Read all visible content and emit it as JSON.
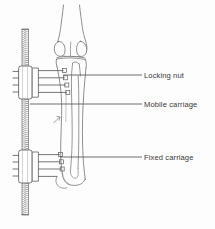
{
  "figure": {
    "background_color": "#fdfdfd",
    "line_color": "#555555",
    "text_color": "#3a3a3a"
  },
  "labels": [
    {
      "id": "locking-nut",
      "text": "Locking nut",
      "leader_y": 75,
      "leader_x_start": 63,
      "leader_x_end": 142
    },
    {
      "id": "mobile-carriage",
      "text": "Mobile carriage",
      "leader_y": 104,
      "leader_x_start": 30,
      "leader_x_end": 142
    },
    {
      "id": "fixed-carriage",
      "text": "Fixed carriage",
      "leader_y": 157,
      "leader_x_start": 60,
      "leader_x_end": 142
    }
  ],
  "anatomy": {
    "femur": "femur shaft with condyles",
    "patella_region": "knee joint line",
    "tibia": "tibia shaft",
    "fibula": "fibula shaft"
  },
  "device": {
    "threaded_rod": "vertical threaded rod",
    "carriages": [
      {
        "name": "mobile carriage",
        "pin_count": 4
      },
      {
        "name": "fixed carriage",
        "pin_count": 4
      }
    ]
  }
}
